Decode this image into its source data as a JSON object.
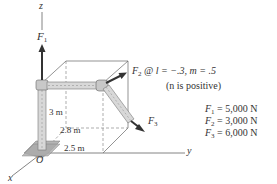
{
  "diagram": {
    "axes": {
      "z": "z",
      "y": "y",
      "x": "x",
      "origin": "O"
    },
    "forces": {
      "F1": {
        "symbol": "F",
        "sub": "1"
      },
      "F2": {
        "symbol": "F",
        "sub": "2",
        "direction": "@ l = −.3, m = .5",
        "note": "(n is positive)"
      },
      "F3": {
        "symbol": "F",
        "sub": "3"
      }
    },
    "dimensions": {
      "height": "3 m",
      "depth": "2.8 m",
      "width": "2.5 m"
    },
    "magnitudes": [
      {
        "symbol": "F",
        "sub": "1",
        "value": "= 5,000 N"
      },
      {
        "symbol": "F",
        "sub": "2",
        "value": "= 3,000 N"
      },
      {
        "symbol": "F",
        "sub": "3",
        "value": "= 6,000 N"
      }
    ],
    "colors": {
      "line": "#555555",
      "arrow": "#333333",
      "pipe": "#cfcfcf",
      "base": "#b5b5b5"
    }
  }
}
